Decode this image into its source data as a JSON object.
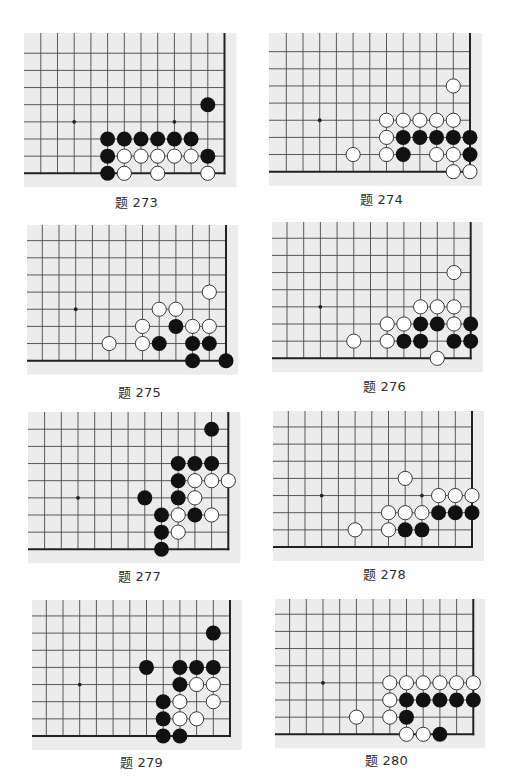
{
  "problems": [
    {
      "label": "题 273",
      "star_points": [
        [
          9,
          3
        ],
        [
          3,
          3
        ]
      ],
      "black": [
        [
          1,
          4
        ],
        [
          7,
          2
        ],
        [
          6,
          2
        ],
        [
          5,
          2
        ],
        [
          4,
          2
        ],
        [
          3,
          2
        ],
        [
          2,
          2
        ],
        [
          7,
          1
        ],
        [
          1,
          1
        ],
        [
          7,
          0
        ]
      ],
      "white": [
        [
          6,
          1
        ],
        [
          5,
          1
        ],
        [
          4,
          1
        ],
        [
          3,
          1
        ],
        [
          2,
          1
        ],
        [
          6,
          0
        ],
        [
          4,
          0
        ],
        [
          1,
          0
        ]
      ]
    },
    {
      "label": "题 274",
      "star_points": [
        [
          9,
          3
        ]
      ],
      "black": [
        [
          4,
          2
        ],
        [
          3,
          2
        ],
        [
          2,
          2
        ],
        [
          1,
          2
        ],
        [
          0,
          2
        ],
        [
          4,
          1
        ],
        [
          0,
          1
        ]
      ],
      "white": [
        [
          1,
          5
        ],
        [
          5,
          3
        ],
        [
          4,
          3
        ],
        [
          3,
          3
        ],
        [
          2,
          3
        ],
        [
          1,
          3
        ],
        [
          5,
          2
        ],
        [
          7,
          1
        ],
        [
          5,
          1
        ],
        [
          2,
          1
        ],
        [
          1,
          1
        ],
        [
          1,
          0
        ],
        [
          0,
          0
        ]
      ]
    },
    {
      "label": "题 275",
      "star_points": [
        [
          9,
          3
        ]
      ],
      "black": [
        [
          3,
          2
        ],
        [
          4,
          1
        ],
        [
          2,
          1
        ],
        [
          1,
          1
        ],
        [
          2,
          0
        ],
        [
          0,
          0
        ]
      ],
      "white": [
        [
          1,
          4
        ],
        [
          4,
          3
        ],
        [
          3,
          3
        ],
        [
          5,
          2
        ],
        [
          2,
          2
        ],
        [
          1,
          2
        ],
        [
          7,
          1
        ],
        [
          5,
          1
        ]
      ]
    },
    {
      "label": "题 276",
      "star_points": [
        [
          9,
          3
        ]
      ],
      "black": [
        [
          3,
          2
        ],
        [
          2,
          2
        ],
        [
          0,
          2
        ],
        [
          4,
          1
        ],
        [
          3,
          1
        ],
        [
          1,
          1
        ],
        [
          0,
          1
        ]
      ],
      "white": [
        [
          1,
          5
        ],
        [
          3,
          3
        ],
        [
          2,
          3
        ],
        [
          1,
          3
        ],
        [
          5,
          2
        ],
        [
          4,
          2
        ],
        [
          1,
          2
        ],
        [
          7,
          1
        ],
        [
          5,
          1
        ],
        [
          2,
          0
        ]
      ]
    },
    {
      "label": "题 277",
      "star_points": [
        [
          9,
          3
        ]
      ],
      "black": [
        [
          1,
          7
        ],
        [
          3,
          5
        ],
        [
          2,
          5
        ],
        [
          1,
          5
        ],
        [
          3,
          4
        ],
        [
          5,
          3
        ],
        [
          3,
          3
        ],
        [
          4,
          2
        ],
        [
          2,
          2
        ],
        [
          4,
          1
        ],
        [
          4,
          0
        ]
      ],
      "white": [
        [
          2,
          4
        ],
        [
          1,
          4
        ],
        [
          0,
          4
        ],
        [
          2,
          3
        ],
        [
          3,
          2
        ],
        [
          1,
          2
        ],
        [
          3,
          1
        ]
      ]
    },
    {
      "label": "题 278",
      "star_points": [
        [
          9,
          3
        ],
        [
          3,
          3
        ]
      ],
      "black": [
        [
          2,
          2
        ],
        [
          1,
          2
        ],
        [
          0,
          2
        ],
        [
          4,
          1
        ],
        [
          3,
          1
        ]
      ],
      "white": [
        [
          4,
          4
        ],
        [
          2,
          3
        ],
        [
          1,
          3
        ],
        [
          0,
          3
        ],
        [
          5,
          2
        ],
        [
          4,
          2
        ],
        [
          3,
          2
        ],
        [
          7,
          1
        ],
        [
          5,
          1
        ]
      ]
    },
    {
      "label": "题 279",
      "star_points": [
        [
          9,
          3
        ]
      ],
      "black": [
        [
          1,
          6
        ],
        [
          5,
          4
        ],
        [
          3,
          4
        ],
        [
          2,
          4
        ],
        [
          1,
          4
        ],
        [
          3,
          3
        ],
        [
          4,
          2
        ],
        [
          4,
          1
        ],
        [
          4,
          0
        ],
        [
          3,
          0
        ]
      ],
      "white": [
        [
          2,
          3
        ],
        [
          1,
          3
        ],
        [
          3,
          2
        ],
        [
          1,
          2
        ],
        [
          3,
          1
        ],
        [
          2,
          1
        ]
      ]
    },
    {
      "label": "题 280",
      "star_points": [
        [
          9,
          3
        ]
      ],
      "black": [
        [
          4,
          2
        ],
        [
          3,
          2
        ],
        [
          2,
          2
        ],
        [
          1,
          2
        ],
        [
          0,
          2
        ],
        [
          4,
          1
        ],
        [
          2,
          0
        ]
      ],
      "white": [
        [
          5,
          3
        ],
        [
          4,
          3
        ],
        [
          3,
          3
        ],
        [
          2,
          3
        ],
        [
          1,
          3
        ],
        [
          0,
          3
        ],
        [
          5,
          2
        ],
        [
          7,
          1
        ],
        [
          5,
          1
        ],
        [
          4,
          0
        ],
        [
          3,
          0
        ]
      ]
    }
  ],
  "colors": {
    "board_background": "#ececec",
    "grid_line": "#474747",
    "edge_line": "#222222",
    "black_stone": "#111111",
    "white_stone": "#ffffff",
    "caption_text": "#2e2e2e"
  }
}
